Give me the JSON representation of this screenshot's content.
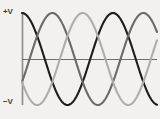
{
  "figure": {
    "background_color": "#f3f1ef",
    "width": 160,
    "height": 119
  },
  "labels": {
    "positive_voltage": "+V",
    "negative_voltage": "−V"
  },
  "axes": {
    "vertical_axis_color": "#8a8a8a",
    "horizontal_axis_color": "#6e6e6e",
    "origin_x": 22,
    "zero_line_y": 59,
    "top_y": 13,
    "bottom_y": 105,
    "right_x": 157
  },
  "chart_data": {
    "type": "line",
    "title": "",
    "xlabel": "",
    "ylabel": "",
    "ylim": [
      -1,
      1
    ],
    "xlim": [
      0,
      1.48
    ],
    "grid": false,
    "legend_position": "none",
    "y_tick_labels": [
      "+V",
      "−V"
    ],
    "x_tick_labels": [],
    "amplitude": 1,
    "period_px": 91,
    "cycles_shown": 1.48,
    "series": [
      {
        "name": "Phase A",
        "color": "#1c1c1c",
        "phase_degrees": 90,
        "stroke_width": 2.1,
        "peak_x_px": [
          22,
          113
        ],
        "trough_x_px": [
          68,
          159
        ]
      },
      {
        "name": "Phase B",
        "color": "#6a6a6a",
        "phase_degrees": -30,
        "stroke_width": 2.1,
        "peak_x_px": [
          52,
          143
        ],
        "trough_x_px": [
          98
        ]
      },
      {
        "name": "Phase C",
        "color": "#adadad",
        "phase_degrees": 210,
        "stroke_width": 2.1,
        "peak_x_px": [
          83
        ],
        "trough_x_px": [
          37,
          128
        ]
      }
    ]
  }
}
